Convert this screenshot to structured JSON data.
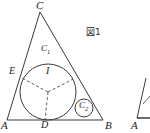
{
  "figure": {
    "caption": "図1",
    "caption_position": {
      "x": 86,
      "y": 28
    },
    "stroke_color": "#3a3a3a",
    "background_color": "#ffffff",
    "width": 150,
    "height": 133
  },
  "triangle": {
    "name": "ABC",
    "vertices": [
      {
        "label": "C",
        "x": 40,
        "y": 12,
        "label_x": 36,
        "label_y": 0
      },
      {
        "label": "A",
        "x": 7,
        "y": 120,
        "label_x": 1,
        "label_y": 121
      },
      {
        "label": "B",
        "x": 103,
        "y": 120,
        "label_x": 105,
        "label_y": 121
      }
    ]
  },
  "incircle": {
    "label": "C",
    "subscript": "1",
    "center": {
      "x": 48,
      "y": 92
    },
    "radius": 28,
    "label_x": 41,
    "label_y": 44,
    "center_label": "I",
    "center_label_x": 45,
    "center_label_y": 67
  },
  "small_circle": {
    "label": "C",
    "subscript": "2",
    "center": {
      "x": 84,
      "y": 108
    },
    "radius": 9,
    "label_x": 79,
    "label_y": 98
  },
  "tangent_points": [
    {
      "label": "E",
      "x": 22,
      "y": 78,
      "label_x": 9,
      "label_y": 67
    },
    {
      "label": "D",
      "x": 45,
      "y": 120,
      "label_x": 41,
      "label_y": 121
    },
    {
      "label": "",
      "x": 70,
      "y": 76,
      "label_x": 0,
      "label_y": 0
    }
  ],
  "secondary_figure": {
    "label": "A",
    "label_x": 131,
    "label_y": 121,
    "apex": {
      "x": 146,
      "y": 78
    },
    "base_left": {
      "x": 137,
      "y": 118
    },
    "base_right": {
      "x": 150,
      "y": 118
    }
  }
}
